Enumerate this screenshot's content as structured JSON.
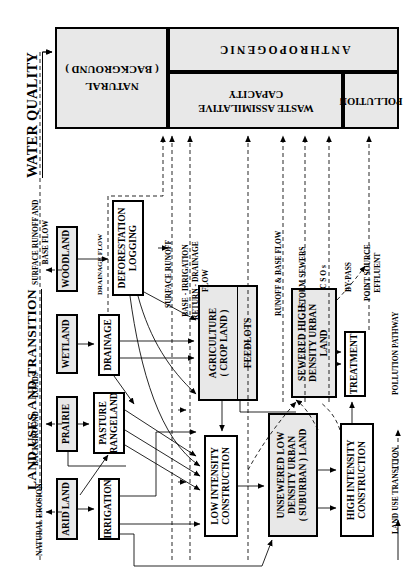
{
  "figure": {
    "headings": {
      "water_quality": "WATER QUALITY",
      "land_uses": "LAND USES AND TRANSITION"
    }
  },
  "water_quality_box": {
    "natural": {
      "line1": "NATURAL",
      "line2": "( BACKGROUND )"
    },
    "anthropogenic": {
      "label": "ANTHROPOGENIC"
    },
    "waste_capacity": {
      "line1": "WASTE ASSIMILATIVE",
      "line2": "CAPACITY"
    },
    "pollution": {
      "label": "POLLUTION"
    }
  },
  "nodes": [
    {
      "id": "woodland",
      "label": "WOODLAND",
      "shaded": true
    },
    {
      "id": "wetland",
      "label": "WETLAND",
      "shaded": true
    },
    {
      "id": "prairie",
      "label": "PRAIRIE",
      "shaded": true
    },
    {
      "id": "arid-land",
      "label": "ARID LAND",
      "shaded": true
    },
    {
      "id": "drainage",
      "label": "DRAINAGE",
      "shaded": false
    },
    {
      "id": "pasture-rangeland",
      "line1": "PASTURE",
      "line2": "RANGELAND",
      "shaded": false
    },
    {
      "id": "irrigation",
      "label": "IRRIGATION",
      "shaded": false
    },
    {
      "id": "deforestation-logging",
      "line1": "DEFORESTATION",
      "line2": "LOGGING",
      "shaded": false
    },
    {
      "id": "agriculture",
      "line1": "AGRICULTURE",
      "line2": "( CROP LAND )",
      "shaded": true
    },
    {
      "id": "feedlots",
      "label": "FEEDLOTS",
      "shaded": true
    },
    {
      "id": "sewered-high-density-urban-land",
      "line1": "SEWERED  HIGH",
      "line2": "DENSITY URBAN",
      "line3": "LAND",
      "shaded": true
    },
    {
      "id": "low-intensity-construction",
      "line1": "LOW INTENSITY",
      "line2": "CONSTRUCTION",
      "shaded": false
    },
    {
      "id": "unsewered-low-density-urban-suburban-land",
      "line1": "UNSEWERED LOW",
      "line2": "DENSITY URBAN",
      "line3": "( SUBURBAN )  LAND",
      "shaded": true
    },
    {
      "id": "high-intensity-construction",
      "line1": "HIGH INTENSITY",
      "line2": "CONSTRUCTION",
      "shaded": false
    },
    {
      "id": "treatment",
      "label": "TREATMENT",
      "shaded": false
    }
  ],
  "pathway_labels": [
    {
      "id": "natural-erosion",
      "text": "NATURAL EROSION"
    },
    {
      "id": "background-loads",
      "line1": "BACKGROUND",
      "line2": "LOADS"
    },
    {
      "id": "surface-runoff-base-flow",
      "line1": "SURFACE  RUNOFF  AND",
      "line2": "BASE FLOW"
    },
    {
      "id": "drainage-flow",
      "text": "DRAINAGE FLOW"
    },
    {
      "id": "surface-runoff",
      "text": "SURFACE RUNOFF"
    },
    {
      "id": "base-irrigation-return-drainage-flow",
      "line1": "BASE - IRRIGATION",
      "line2": "RETURN - DRAINAGE",
      "line3": "FLOW"
    },
    {
      "id": "runoff-base-flow",
      "text": "RUNOFF  &  BASE FLOW"
    },
    {
      "id": "storm-sewers",
      "text": "STORM SEWERS"
    },
    {
      "id": "csos",
      "text": "C S O s"
    },
    {
      "id": "by-pass",
      "text": "BY-PASS"
    },
    {
      "id": "point-source-effluent",
      "line1": "POINT SOURCE",
      "line2": "EFFLUENT"
    }
  ],
  "legend": {
    "land_use_transition": "LAND USE TRANSITION",
    "pollution_pathway": "POLLUTION PATHWAY"
  },
  "colors": {
    "ink": "#000000",
    "shade_fill": "#e8e8e8",
    "paper": "#ffffff"
  }
}
